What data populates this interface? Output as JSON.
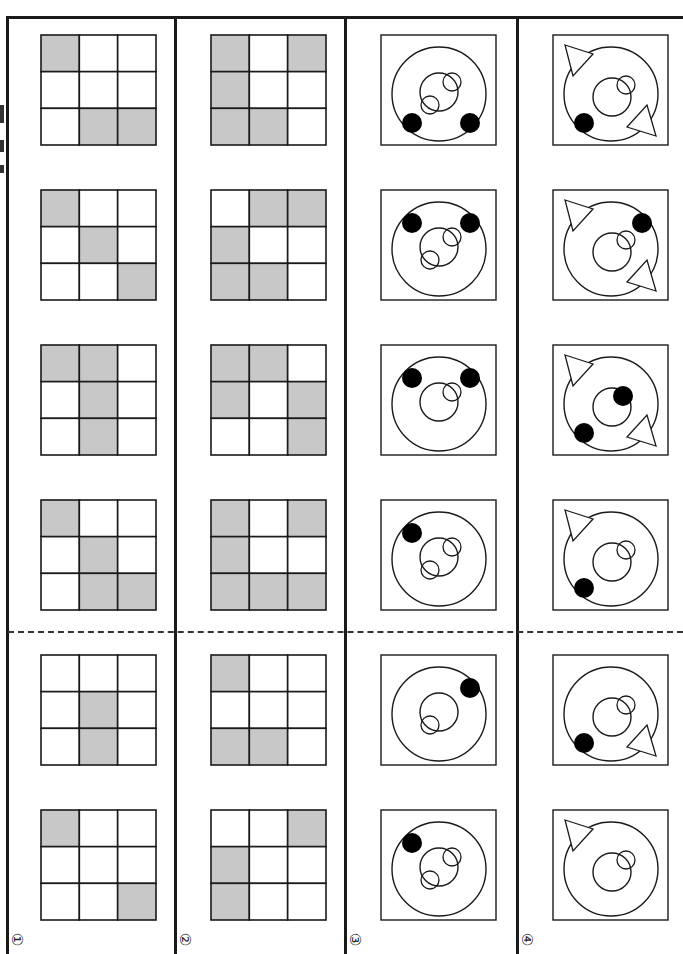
{
  "page": {
    "orientation": "rotated-90",
    "colors": {
      "line": "#1a1a1a",
      "shade": "#c8c8c8",
      "fill_dot": "#000000",
      "background": "#ffffff"
    },
    "dashed_divider": {
      "between_rows": "4 and 5"
    }
  },
  "options": [
    {
      "label": "①",
      "type": "grid",
      "figures": [
        {
          "cells": [
            1,
            0,
            0,
            0,
            0,
            0,
            0,
            1,
            1
          ]
        },
        {
          "cells": [
            1,
            0,
            0,
            0,
            1,
            0,
            0,
            0,
            1
          ]
        },
        {
          "cells": [
            1,
            1,
            0,
            0,
            1,
            0,
            0,
            1,
            0
          ]
        },
        {
          "cells": [
            1,
            0,
            0,
            0,
            1,
            0,
            0,
            1,
            1
          ]
        },
        {
          "cells": [
            0,
            0,
            0,
            0,
            1,
            0,
            0,
            1,
            0
          ]
        },
        {
          "cells": [
            1,
            0,
            0,
            0,
            0,
            0,
            0,
            0,
            1
          ]
        }
      ]
    },
    {
      "label": "②",
      "type": "grid",
      "figures": [
        {
          "cells": [
            1,
            0,
            1,
            1,
            0,
            0,
            1,
            1,
            0
          ]
        },
        {
          "cells": [
            0,
            1,
            1,
            1,
            0,
            0,
            1,
            1,
            0
          ]
        },
        {
          "cells": [
            1,
            1,
            0,
            1,
            0,
            1,
            0,
            0,
            1
          ]
        },
        {
          "cells": [
            1,
            0,
            1,
            1,
            0,
            0,
            1,
            1,
            1
          ]
        },
        {
          "cells": [
            1,
            0,
            0,
            0,
            0,
            0,
            1,
            1,
            0
          ]
        },
        {
          "cells": [
            0,
            0,
            1,
            1,
            0,
            0,
            1,
            0,
            0
          ]
        }
      ]
    },
    {
      "label": "③",
      "type": "circles",
      "figures": [
        {
          "dots": [
            "bottom-left",
            "bottom-right"
          ],
          "small_circles": [
            "top-right",
            "bottom-left"
          ],
          "inner_dot": false,
          "triangles": []
        },
        {
          "dots": [
            "top-left",
            "top-right"
          ],
          "small_circles": [
            "top-right",
            "bottom-left"
          ],
          "inner_dot": false,
          "triangles": []
        },
        {
          "dots": [
            "top-left",
            "top-right"
          ],
          "small_circles": [
            "top-right"
          ],
          "inner_dot": false,
          "triangles": []
        },
        {
          "dots": [
            "top-left"
          ],
          "small_circles": [
            "top-right",
            "bottom-left"
          ],
          "inner_dot": false,
          "triangles": []
        },
        {
          "dots": [
            "top-right"
          ],
          "small_circles": [
            "bottom-left"
          ],
          "inner_dot": false,
          "triangles": []
        },
        {
          "dots": [
            "top-left"
          ],
          "small_circles": [
            "top-right",
            "bottom-left"
          ],
          "inner_dot": false,
          "triangles": []
        }
      ]
    },
    {
      "label": "④",
      "type": "circles",
      "figures": [
        {
          "dots": [
            "bottom-left"
          ],
          "small_circles": [
            "top-right"
          ],
          "inner_dot": false,
          "triangles": [
            "top-left",
            "bottom-right"
          ]
        },
        {
          "dots": [
            "top-right"
          ],
          "small_circles": [
            "top-right"
          ],
          "inner_dot": false,
          "triangles": [
            "top-left",
            "bottom-right"
          ]
        },
        {
          "dots": [
            "bottom-left"
          ],
          "small_circles": [],
          "inner_dot": true,
          "triangles": [
            "top-left",
            "bottom-right"
          ]
        },
        {
          "dots": [
            "bottom-left"
          ],
          "small_circles": [
            "top-right"
          ],
          "inner_dot": false,
          "triangles": [
            "top-left"
          ]
        },
        {
          "dots": [
            "bottom-left"
          ],
          "small_circles": [
            "top-right"
          ],
          "inner_dot": false,
          "triangles": [
            "bottom-right"
          ]
        },
        {
          "dots": [],
          "small_circles": [
            "top-right"
          ],
          "inner_dot": false,
          "triangles": [
            "top-left"
          ]
        }
      ]
    }
  ]
}
